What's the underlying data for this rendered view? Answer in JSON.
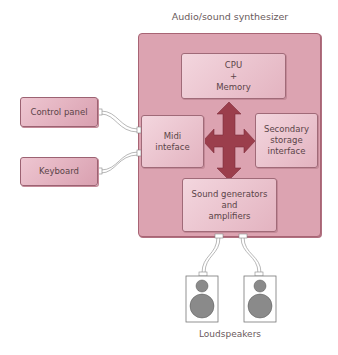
{
  "diagram": {
    "title": "Audio/sound synthesizer",
    "components": {
      "cpu": [
        "CPU",
        "+",
        "Memory"
      ],
      "midi": [
        "Midi",
        "inteface"
      ],
      "secondary": [
        "Secondary",
        "storage",
        "interface"
      ],
      "sound": [
        "Sound generators",
        "and",
        "amplifiers"
      ]
    },
    "external": {
      "control_panel": "Control panel",
      "keyboard": "Keyboard"
    },
    "speakers_label": "Loudspeakers",
    "colors": {
      "outer_fill": "#dca3b1",
      "box_fill": "#f3d6de",
      "arrow": "#9b3e4c",
      "border": "#a06a78"
    }
  }
}
